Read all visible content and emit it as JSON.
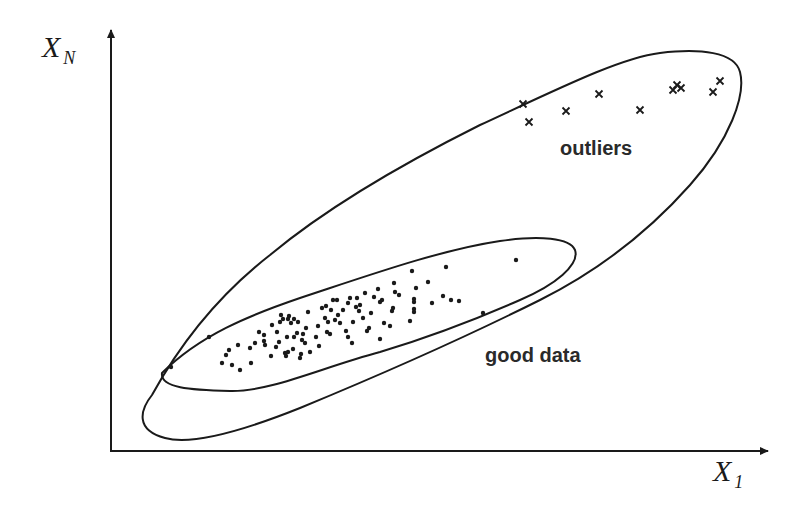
{
  "axes": {
    "y_label_main": "X",
    "y_label_sub": "N",
    "x_label_main": "X",
    "x_label_sub": "1"
  },
  "regions": {
    "outliers_label": "outliers",
    "good_data_label": "good data"
  },
  "colors": {
    "ink": "#1a1a1a",
    "background": "#ffffff"
  },
  "good_points": [
    [
      171,
      367
    ],
    [
      209,
      337
    ],
    [
      222,
      363
    ],
    [
      226,
      355
    ],
    [
      229,
      350
    ],
    [
      232,
      365
    ],
    [
      238,
      345
    ],
    [
      240,
      370
    ],
    [
      251,
      363
    ],
    [
      255,
      343
    ],
    [
      259,
      332
    ],
    [
      264,
      335
    ],
    [
      264,
      341
    ],
    [
      265,
      345
    ],
    [
      272,
      325
    ],
    [
      276,
      347
    ],
    [
      279,
      342
    ],
    [
      277,
      332
    ],
    [
      280,
      322
    ],
    [
      281,
      315
    ],
    [
      283,
      319
    ],
    [
      285,
      353
    ],
    [
      286,
      356
    ],
    [
      287,
      337
    ],
    [
      288,
      352
    ],
    [
      288,
      319
    ],
    [
      289,
      316
    ],
    [
      291,
      323
    ],
    [
      293,
      349
    ],
    [
      294,
      337
    ],
    [
      294,
      319
    ],
    [
      297,
      333
    ],
    [
      298,
      322
    ],
    [
      300,
      358
    ],
    [
      301,
      354
    ],
    [
      302,
      340
    ],
    [
      303,
      334
    ],
    [
      305,
      343
    ],
    [
      306,
      328
    ],
    [
      308,
      312
    ],
    [
      310,
      352
    ],
    [
      316,
      337
    ],
    [
      318,
      326
    ],
    [
      319,
      346
    ],
    [
      322,
      308
    ],
    [
      325,
      318
    ],
    [
      326,
      306
    ],
    [
      327,
      332
    ],
    [
      328,
      322
    ],
    [
      330,
      334
    ],
    [
      331,
      310
    ],
    [
      333,
      300
    ],
    [
      335,
      320
    ],
    [
      337,
      300
    ],
    [
      338,
      315
    ],
    [
      340,
      323
    ],
    [
      343,
      310
    ],
    [
      346,
      331
    ],
    [
      348,
      303
    ],
    [
      350,
      298
    ],
    [
      352,
      343
    ],
    [
      353,
      322
    ],
    [
      356,
      307
    ],
    [
      357,
      298
    ],
    [
      359,
      311
    ],
    [
      360,
      305
    ],
    [
      363,
      318
    ],
    [
      365,
      293
    ],
    [
      367,
      331
    ],
    [
      369,
      328
    ],
    [
      371,
      313
    ],
    [
      374,
      297
    ],
    [
      378,
      289
    ],
    [
      380,
      339
    ],
    [
      382,
      300
    ],
    [
      384,
      323
    ],
    [
      390,
      326
    ],
    [
      392,
      311
    ],
    [
      393,
      308
    ],
    [
      394,
      283
    ],
    [
      399,
      295
    ],
    [
      412,
      271
    ],
    [
      414,
      299
    ],
    [
      410,
      321
    ],
    [
      416,
      288
    ],
    [
      414,
      302
    ],
    [
      414,
      309
    ],
    [
      414,
      312
    ],
    [
      428,
      282
    ],
    [
      432,
      303
    ],
    [
      443,
      296
    ],
    [
      446,
      267
    ],
    [
      451,
      300
    ],
    [
      459,
      301
    ],
    [
      483,
      313
    ],
    [
      516,
      260
    ],
    [
      395,
      292
    ],
    [
      380,
      302
    ],
    [
      348,
      337
    ],
    [
      271,
      356
    ],
    [
      250,
      348
    ]
  ],
  "outlier_points": [
    [
      523,
      104
    ],
    [
      529,
      122
    ],
    [
      566,
      111
    ],
    [
      599,
      94
    ],
    [
      640,
      110
    ],
    [
      673,
      90
    ],
    [
      677,
      85
    ],
    [
      681,
      88
    ],
    [
      713,
      92
    ],
    [
      720,
      81
    ]
  ]
}
